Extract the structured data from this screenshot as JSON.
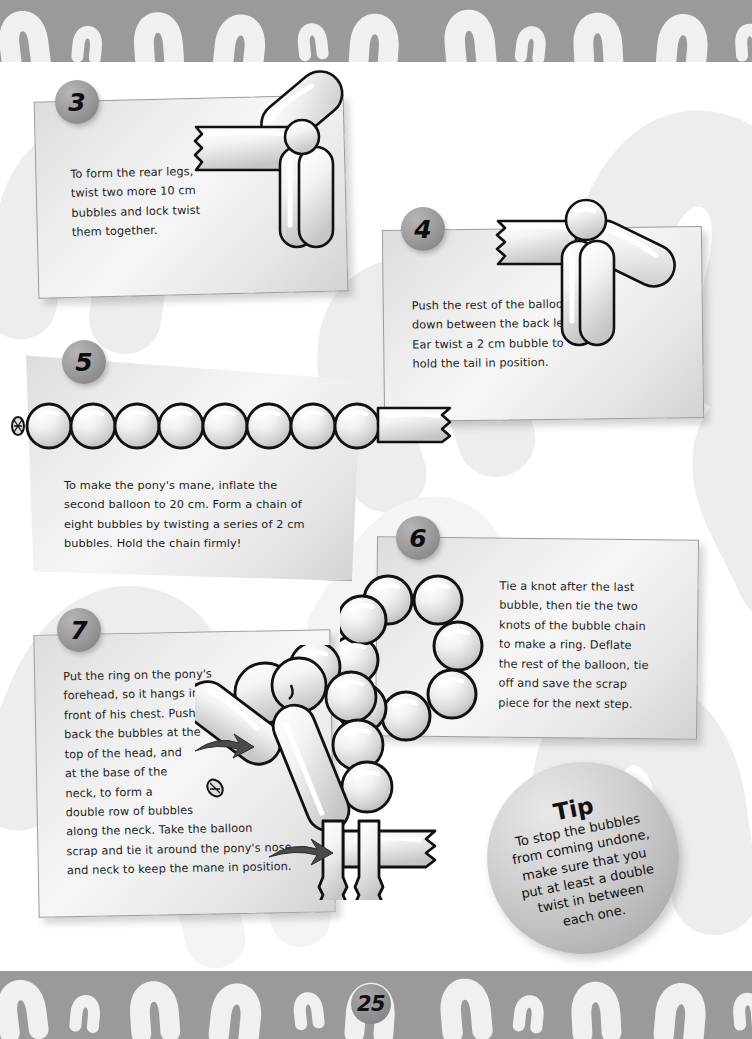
{
  "page": {
    "number": "25",
    "border_color": "#9a9a9a",
    "panel_fill": "#e9e9e9",
    "badge_color": "#989898",
    "background": "#ffffff"
  },
  "steps": [
    {
      "number": "3",
      "text": "To form the rear legs,\ntwist two more 10 cm\nbubbles and lock twist\nthem together.",
      "illustration": "balloon-rear-legs"
    },
    {
      "number": "4",
      "text": "Push the rest of the balloon\ndown between the back legs.\nEar twist a 2 cm bubble to\nhold the tail in position.",
      "illustration": "balloon-tail-twist"
    },
    {
      "number": "5",
      "text": "To make the pony's mane, inflate the\nsecond balloon to 20 cm. Form a chain of\neight bubbles by twisting a series of 2 cm\nbubbles. Hold the chain firmly!",
      "illustration": "bubble-chain-eight"
    },
    {
      "number": "6",
      "text": "Tie a knot after the last\nbubble, then tie the two\nknots of the bubble chain\nto make a ring. Deflate\nthe rest of the balloon, tie\noff and save the scrap\npiece for the next step.",
      "illustration": "bubble-ring-eight"
    },
    {
      "number": "7",
      "text": "Put the ring on the pony's\nforehead, so it hangs in\nfront of his chest. Push\nback the bubbles at the\ntop of the head, and\nat the base of the\nneck, to form a\ndouble row of bubbles\nalong the neck. Take the balloon\nscrap and tie it around the pony's nose\nand neck to keep the mane in position.",
      "illustration": "balloon-pony-with-mane"
    }
  ],
  "tip": {
    "title": "Tip",
    "body": "To stop the bubbles\nfrom coming undone,\nmake sure that you\nput at least a double\ntwist in between\neach one."
  },
  "decor": {
    "border_pattern": "horseshoe-row",
    "watermark_pattern": "large-faint-horseshoes"
  }
}
